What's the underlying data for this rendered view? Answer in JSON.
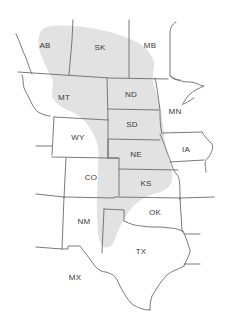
{
  "map": {
    "description": "Range map of central North America with shaded distribution region",
    "colors": {
      "range_fill": "#e2e2e2",
      "border": "#6b6b6b",
      "label": "#3a3a3a",
      "background": "#ffffff"
    },
    "labels": {
      "AB": "AB",
      "SK": "SK",
      "MB": "MB",
      "MT": "MT",
      "ND": "ND",
      "MN": "MN",
      "SD": "SD",
      "WY": "WY",
      "NE": "NE",
      "IA": "IA",
      "CO": "CO",
      "KS": "KS",
      "NM": "NM",
      "OK": "OK",
      "TX": "TX",
      "MX": "MX"
    },
    "regions": [
      {
        "code": "AB",
        "name": "Alberta",
        "shaded": true
      },
      {
        "code": "SK",
        "name": "Saskatchewan",
        "shaded": true
      },
      {
        "code": "MB",
        "name": "Manitoba",
        "shaded": "partial"
      },
      {
        "code": "MT",
        "name": "Montana",
        "shaded": "partial"
      },
      {
        "code": "ND",
        "name": "North Dakota",
        "shaded": true
      },
      {
        "code": "MN",
        "name": "Minnesota",
        "shaded": false
      },
      {
        "code": "SD",
        "name": "South Dakota",
        "shaded": true
      },
      {
        "code": "WY",
        "name": "Wyoming",
        "shaded": "partial"
      },
      {
        "code": "NE",
        "name": "Nebraska",
        "shaded": true
      },
      {
        "code": "IA",
        "name": "Iowa",
        "shaded": false
      },
      {
        "code": "CO",
        "name": "Colorado",
        "shaded": "partial"
      },
      {
        "code": "KS",
        "name": "Kansas",
        "shaded": true
      },
      {
        "code": "NM",
        "name": "New Mexico",
        "shaded": "partial"
      },
      {
        "code": "OK",
        "name": "Oklahoma",
        "shaded": "partial"
      },
      {
        "code": "TX",
        "name": "Texas",
        "shaded": "partial"
      },
      {
        "code": "MX",
        "name": "Mexico",
        "shaded": false
      }
    ]
  }
}
